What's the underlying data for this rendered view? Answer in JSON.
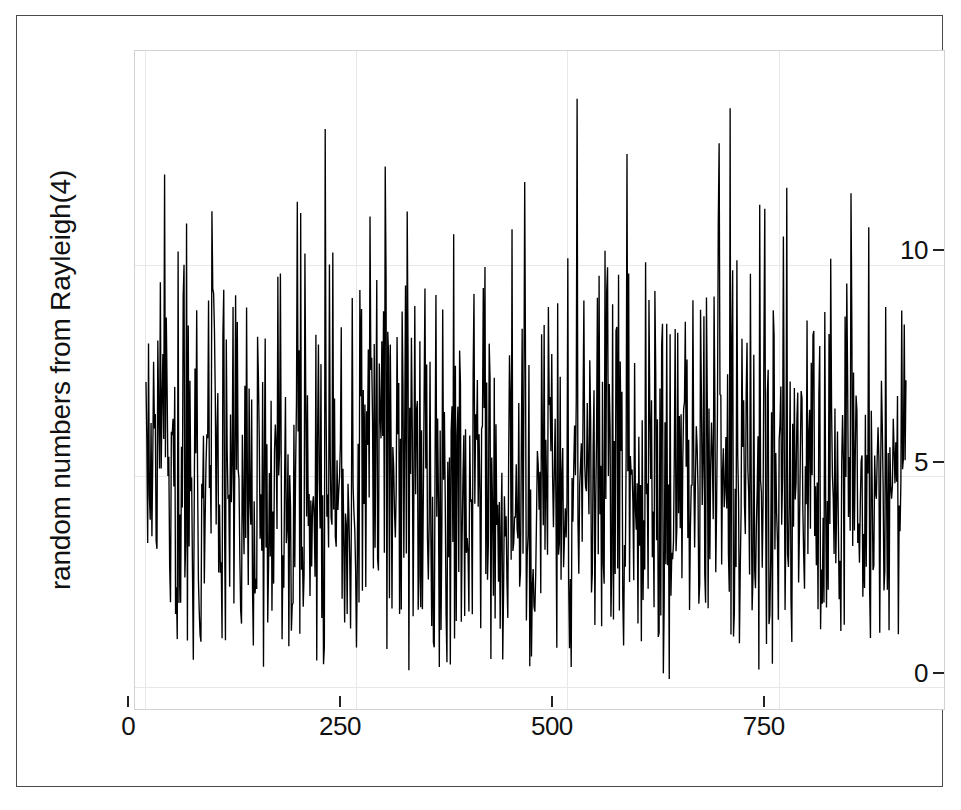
{
  "figure": {
    "background_color": "#ffffff",
    "frame_color": "#4a4a4a",
    "panel_border_color": "#d2d2d2",
    "grid_color": "#e8e8e8",
    "line_color": "#000000"
  },
  "chart_data": {
    "type": "line",
    "title": "",
    "subtitle": "",
    "xlabel": "",
    "ylabel": "random numbers from Rayleigh(4)",
    "xlim": [
      -12,
      945
    ],
    "ylim": [
      -0.52,
      15.1
    ],
    "xticks": [
      0,
      250,
      500,
      750
    ],
    "xtick_labels": [
      "0",
      "250",
      "500",
      "750"
    ],
    "yticks": [
      0,
      5,
      10
    ],
    "ytick_labels": [
      "0",
      "5",
      "10"
    ],
    "grid": true,
    "grid_axis": "both",
    "legend": null,
    "legend_position": "none",
    "annotations": [],
    "n_points": 900,
    "distribution": "Rayleigh",
    "scale_parameter": 4,
    "observed_min": 0.12,
    "observed_max": 14.25,
    "observed_mean": 5.01,
    "series": [
      {
        "name": "random numbers from Rayleigh(4)",
        "color": "#000000",
        "line_width": 1.35,
        "x_start": 1,
        "x_step": 1,
        "note": "900 pseudo-random Rayleigh(sigma=4) deviates plotted as a connected line in index order",
        "seed": 20240517
      }
    ]
  }
}
